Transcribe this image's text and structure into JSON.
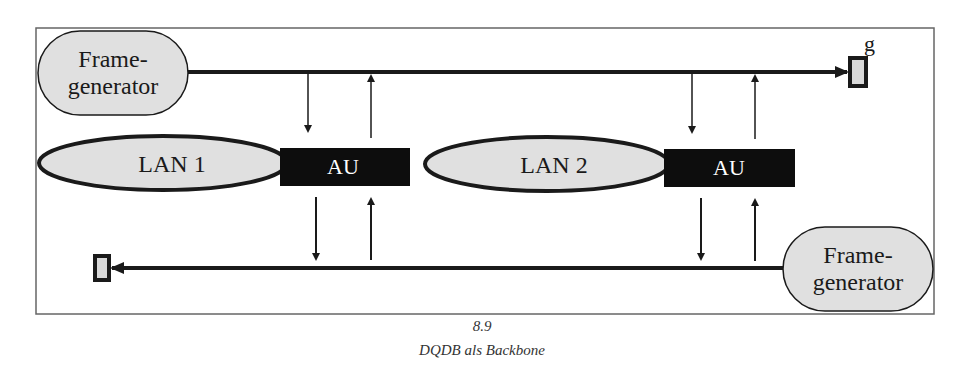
{
  "diagram": {
    "frame_generator_top": {
      "line1": "Frame-",
      "line2": "generator"
    },
    "frame_generator_bottom": {
      "line1": "Frame-",
      "line2": "generator"
    },
    "lan1": {
      "label": "LAN 1"
    },
    "lan2": {
      "label": "LAN 2"
    },
    "au1": {
      "label": "AU"
    },
    "au2": {
      "label": "AU"
    },
    "terminator_top_label": "g",
    "colors": {
      "node_fill": "#e0e0e0",
      "stroke": "#1a1a1a",
      "au_fill": "#0d0d0d",
      "frame_border": "#666666"
    }
  },
  "caption": {
    "figure_number": "8.9",
    "title": "DQDB als Backbone"
  }
}
